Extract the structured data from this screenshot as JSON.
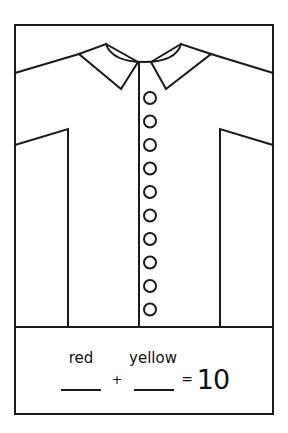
{
  "worksheet": {
    "type": "shirt-button-counting-card",
    "stroke_color": "#1a1a1a",
    "background_color": "#ffffff",
    "shirt": {
      "button_count": 10,
      "buttons": [
        {
          "index": 1
        },
        {
          "index": 2
        },
        {
          "index": 3
        },
        {
          "index": 4
        },
        {
          "index": 5
        },
        {
          "index": 6
        },
        {
          "index": 7
        },
        {
          "index": 8
        },
        {
          "index": 9
        },
        {
          "index": 10
        }
      ]
    },
    "equation": {
      "label_left": "red",
      "label_right": "yellow",
      "blank_left": "",
      "blank_right": "",
      "plus_sign": "+",
      "equals_sign": "=",
      "total": "10"
    }
  }
}
